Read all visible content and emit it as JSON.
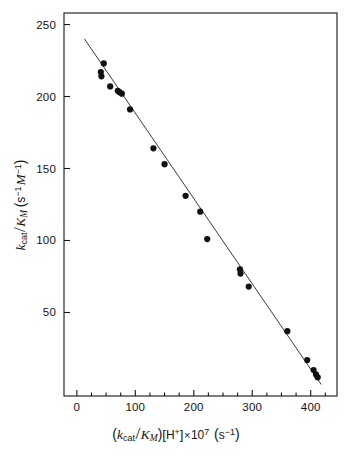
{
  "figure": {
    "background_color": "#ffffff",
    "foreground_color": "#141414",
    "marker_color": "#111111",
    "line_color": "#3a3a3a"
  },
  "axes": {
    "x": {
      "label_parts": {
        "open_paren": "(",
        "k_sym": "k",
        "k_sub": "cat",
        "slash": "/",
        "K_sym": "K",
        "K_sub": "M",
        "close_paren": ")",
        "bracket_open": "[",
        "proton": "H",
        "proton_charge": "+",
        "bracket_close": "]",
        "times": "×",
        "ten": "10",
        "exponent": "7",
        "unit_open": "(",
        "unit_s": "s",
        "unit_exp": "−1",
        "unit_close": ")"
      },
      "label_text": "(kcat/KM)[H+]×10⁷ (s⁻¹)",
      "tick_labels": [
        "0",
        "100",
        "200",
        "300",
        "400"
      ],
      "tick_values": [
        0,
        100,
        200,
        300,
        400
      ],
      "minor_tick_step": 25,
      "range": [
        -22,
        445
      ]
    },
    "y": {
      "label_parts": {
        "k_sym": "k",
        "k_sub": "cat",
        "slash": "/",
        "K_sym": "K",
        "K_sub": "M",
        "unit_open": "(",
        "unit_s": "s",
        "unit_s_exp": "−1",
        "unit_M": "M",
        "unit_M_exp": "−1",
        "unit_close": ")"
      },
      "label_text": "kcat/KM (s⁻¹ M⁻¹)",
      "tick_labels": [
        "50",
        "100",
        "150",
        "200",
        "250"
      ],
      "tick_values": [
        50,
        100,
        150,
        200,
        250
      ],
      "range": [
        -8,
        258
      ]
    }
  },
  "chart_data": {
    "type": "scatter",
    "title": "",
    "xlabel": "(kcat/KM)[H+] × 10⁷ (s⁻¹)",
    "ylabel": "kcat/KM (s⁻¹ M⁻¹)",
    "xlim": [
      -22,
      445
    ],
    "ylim": [
      -8,
      258
    ],
    "xticks": [
      0,
      100,
      200,
      300,
      400
    ],
    "yticks": [
      50,
      100,
      150,
      200,
      250
    ],
    "grid": false,
    "legend": null,
    "frame": "box",
    "series": [
      {
        "name": "kinetic data",
        "marker": "filled-circle",
        "marker_size_px": 5.2,
        "color": "#111111",
        "points": [
          {
            "x": 46,
            "y": 223
          },
          {
            "x": 41,
            "y": 217
          },
          {
            "x": 42,
            "y": 214
          },
          {
            "x": 57,
            "y": 207
          },
          {
            "x": 70,
            "y": 204
          },
          {
            "x": 73,
            "y": 203
          },
          {
            "x": 77,
            "y": 202
          },
          {
            "x": 91,
            "y": 191
          },
          {
            "x": 131,
            "y": 164
          },
          {
            "x": 150,
            "y": 153
          },
          {
            "x": 186,
            "y": 131
          },
          {
            "x": 211,
            "y": 120
          },
          {
            "x": 223,
            "y": 101
          },
          {
            "x": 279,
            "y": 80
          },
          {
            "x": 280,
            "y": 77
          },
          {
            "x": 294,
            "y": 68
          },
          {
            "x": 360,
            "y": 37
          },
          {
            "x": 394,
            "y": 17
          },
          {
            "x": 405,
            "y": 10
          },
          {
            "x": 409,
            "y": 7
          },
          {
            "x": 412,
            "y": 5
          }
        ]
      }
    ],
    "fit_line": {
      "name": "linear regression",
      "type": "line",
      "color": "#3a3a3a",
      "x_start": 13,
      "y_start": 240,
      "x_end": 418,
      "y_end": 0,
      "slope": -0.592,
      "intercept": 247.7
    }
  }
}
